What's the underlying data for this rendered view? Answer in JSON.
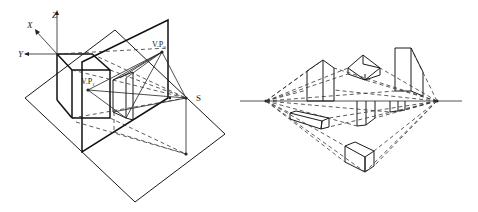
{
  "figure_left": {
    "title": "Perspective projection setup (picture plane, station point, vanishing points)",
    "labels": {
      "axis_x": "X",
      "axis_y": "Y",
      "axis_z": "Z",
      "vp1": "V.P",
      "vp1_sub": "1",
      "vp2": "V.P",
      "vp2_sub": "2",
      "station": "S"
    }
  },
  "figure_right": {
    "title": "Two-point perspective of boxes above and below horizon line",
    "elements": [
      "horizon-line",
      "left-vanishing-point",
      "right-vanishing-point",
      "boxes"
    ]
  },
  "colors": {
    "line": "#1a1a1a",
    "background": "#ffffff"
  }
}
